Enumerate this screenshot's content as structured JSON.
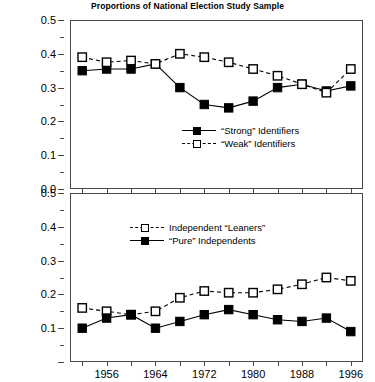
{
  "chart_data": [
    {
      "panel": "top",
      "type": "line",
      "title": "Proportions of National Election Study Sample",
      "xlabel": "",
      "ylabel": "",
      "xlim": [
        1950,
        1998
      ],
      "ylim": [
        0.0,
        0.5
      ],
      "grid": false,
      "legend_position": "inside-lower-center",
      "x": [
        1952,
        1956,
        1960,
        1964,
        1968,
        1972,
        1976,
        1980,
        1984,
        1988,
        1992,
        1996
      ],
      "xticklabels": [
        "1956",
        "1964",
        "1972",
        "1980",
        "1988",
        "1996"
      ],
      "xtickvalues": [
        1956,
        1964,
        1972,
        1980,
        1988,
        1996
      ],
      "yticklabels": [
        "0.5",
        "0.4",
        "0.3",
        "0.2",
        "0.1",
        "0.0"
      ],
      "ytickvalues": [
        0.5,
        0.4,
        0.3,
        0.2,
        0.1,
        0.0
      ],
      "series": [
        {
          "name": "“Strong” Identifiers",
          "marker": "filled-square",
          "linestyle": "solid",
          "color": "#000000",
          "values": [
            0.35,
            0.355,
            0.355,
            0.37,
            0.3,
            0.25,
            0.24,
            0.26,
            0.3,
            0.31,
            0.29,
            0.305
          ]
        },
        {
          "name": "“Weak” Identifiers",
          "marker": "open-square",
          "linestyle": "dashed",
          "color": "#000000",
          "values": [
            0.39,
            0.375,
            0.38,
            0.37,
            0.4,
            0.39,
            0.375,
            0.355,
            0.335,
            0.31,
            0.285,
            0.355
          ]
        }
      ]
    },
    {
      "panel": "bottom",
      "type": "line",
      "title": "",
      "xlabel": "",
      "ylabel": "",
      "xlim": [
        1950,
        1998
      ],
      "ylim": [
        0.0,
        0.5
      ],
      "grid": false,
      "legend_position": "inside-upper-left",
      "x": [
        1952,
        1956,
        1960,
        1964,
        1968,
        1972,
        1976,
        1980,
        1984,
        1988,
        1992,
        1996
      ],
      "xticklabels": [
        "1956",
        "1964",
        "1972",
        "1980",
        "1988",
        "1996"
      ],
      "xtickvalues": [
        1956,
        1964,
        1972,
        1980,
        1988,
        1996
      ],
      "yticklabels": [
        "0.5",
        "0.4",
        "0.3",
        "0.2",
        "0.1"
      ],
      "ytickvalues": [
        0.5,
        0.4,
        0.3,
        0.2,
        0.1
      ],
      "series": [
        {
          "name": "Independent “Leaners”",
          "marker": "open-square",
          "linestyle": "dashed",
          "color": "#000000",
          "values": [
            0.16,
            0.15,
            0.14,
            0.15,
            0.19,
            0.21,
            0.205,
            0.205,
            0.215,
            0.23,
            0.25,
            0.24
          ]
        },
        {
          "name": "“Pure” Independents",
          "marker": "filled-square",
          "linestyle": "solid",
          "color": "#000000",
          "values": [
            0.1,
            0.13,
            0.14,
            0.1,
            0.12,
            0.14,
            0.155,
            0.14,
            0.125,
            0.12,
            0.13,
            0.09
          ]
        }
      ]
    }
  ],
  "title": "Proportions of National Election Study Sample",
  "panels": {
    "top": {
      "yticklabels": [
        "0.5",
        "0.4",
        "0.3",
        "0.2",
        "0.1"
      ],
      "legend": [
        {
          "label": "“Strong” Identifiers",
          "marker": "filled-square",
          "linestyle": "solid"
        },
        {
          "label": "“Weak” Identifiers",
          "marker": "open-square",
          "linestyle": "dashed"
        }
      ]
    },
    "bottom": {
      "yticklabels": [
        "0.5",
        "0.4",
        "0.3",
        "0.2",
        "0.1"
      ],
      "legend": [
        {
          "label": "Independent “Leaners”",
          "marker": "open-square",
          "linestyle": "dashed"
        },
        {
          "label": "“Pure” Independents",
          "marker": "filled-square",
          "linestyle": "solid"
        }
      ],
      "xticklabels": [
        "1956",
        "1964",
        "1972",
        "1980",
        "1988",
        "1996"
      ]
    }
  }
}
